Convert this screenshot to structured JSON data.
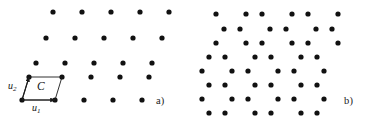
{
  "figure": {
    "background": "#ffffff",
    "dot_color": "#111111",
    "line_color": "#1a1a1a",
    "dot_radius": 2.6,
    "panels": [
      {
        "id": "a",
        "label": "a)",
        "label_x": 156,
        "label_y": 95
      },
      {
        "id": "b",
        "label": "b)",
        "label_x": 344,
        "label_y": 95
      }
    ],
    "annotations": {
      "cell_label": "C",
      "vector1_base": "u",
      "vector1_sub": "1",
      "vector2_base": "u",
      "vector2_sub": "2"
    }
  },
  "chart_data": {
    "type": "scatter",
    "title": "",
    "subtitle": "",
    "xlabel": "",
    "ylabel": "",
    "grid": false,
    "legend": null,
    "xlim": [
      0,
      370
    ],
    "ylim": [
      0,
      124
    ],
    "annotations": [
      {
        "text": "a)",
        "x": 156,
        "y": 100
      },
      {
        "text": "b)",
        "x": 344,
        "y": 100
      },
      {
        "text": "C",
        "x": 42,
        "y": 88
      },
      {
        "text": "u1",
        "x": 38,
        "y": 108
      },
      {
        "text": "u2",
        "x": 13,
        "y": 86
      }
    ],
    "series": [
      {
        "name": "panel-a-lattice",
        "marker": "filled-circle",
        "color": "#111111",
        "points": [
          [
            53,
            12
          ],
          [
            82,
            12
          ],
          [
            111,
            12
          ],
          [
            140,
            12
          ],
          [
            169,
            12
          ],
          [
            46,
            38
          ],
          [
            75,
            38
          ],
          [
            104,
            38
          ],
          [
            133,
            38
          ],
          [
            162,
            38
          ],
          [
            36,
            63
          ],
          [
            65,
            63
          ],
          [
            94,
            63
          ],
          [
            123,
            63
          ],
          [
            152,
            63
          ],
          [
            29,
            77
          ],
          [
            62,
            77
          ],
          [
            91,
            77
          ],
          [
            120,
            77
          ],
          [
            149,
            77
          ],
          [
            22,
            100
          ],
          [
            55,
            100
          ],
          [
            84,
            100
          ],
          [
            113,
            100
          ],
          [
            142,
            100
          ]
        ]
      },
      {
        "name": "panel-b-superlattice",
        "marker": "filled-circle",
        "color": "#111111",
        "points": [
          [
            216,
            14
          ],
          [
            246,
            14
          ],
          [
            262,
            14
          ],
          [
            292,
            14
          ],
          [
            308,
            14
          ],
          [
            338,
            14
          ],
          [
            224,
            29
          ],
          [
            240,
            29
          ],
          [
            270,
            29
          ],
          [
            286,
            29
          ],
          [
            316,
            29
          ],
          [
            332,
            29
          ],
          [
            216,
            43
          ],
          [
            246,
            43
          ],
          [
            262,
            43
          ],
          [
            292,
            43
          ],
          [
            308,
            43
          ],
          [
            338,
            43
          ],
          [
            209,
            57
          ],
          [
            225,
            57
          ],
          [
            255,
            57
          ],
          [
            271,
            57
          ],
          [
            301,
            57
          ],
          [
            317,
            57
          ],
          [
            202,
            71
          ],
          [
            232,
            71
          ],
          [
            248,
            71
          ],
          [
            278,
            71
          ],
          [
            294,
            71
          ],
          [
            324,
            71
          ],
          [
            209,
            85
          ],
          [
            225,
            85
          ],
          [
            255,
            85
          ],
          [
            271,
            85
          ],
          [
            301,
            85
          ],
          [
            317,
            85
          ],
          [
            202,
            99
          ],
          [
            232,
            99
          ],
          [
            248,
            99
          ],
          [
            278,
            99
          ],
          [
            294,
            99
          ],
          [
            324,
            99
          ],
          [
            209,
            113
          ],
          [
            225,
            113
          ],
          [
            255,
            113
          ],
          [
            271,
            113
          ],
          [
            301,
            113
          ],
          [
            317,
            113
          ]
        ]
      }
    ],
    "unit_cell": {
      "name": "primitive-cell-C",
      "shape": "parallelogram",
      "vertices": [
        [
          22,
          100
        ],
        [
          55,
          100
        ],
        [
          62,
          77
        ],
        [
          29,
          77
        ]
      ],
      "vectors": [
        {
          "name": "u1",
          "from": [
            22,
            100
          ],
          "to": [
            55,
            100
          ]
        },
        {
          "name": "u2",
          "from": [
            22,
            100
          ],
          "to": [
            29,
            77
          ]
        }
      ]
    }
  }
}
